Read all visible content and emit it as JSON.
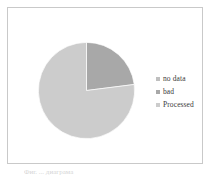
{
  "figure": {
    "background_color": "#ffffff",
    "frame_color": "#c9c9c9",
    "caption_text": "Фиг. ... диаграма"
  },
  "legend": {
    "position": "right",
    "items": [
      {
        "label": "no data",
        "color": "#bfbfbf"
      },
      {
        "label": "bad",
        "color": "#a8a8a8"
      },
      {
        "label": "Processed",
        "color": "#cccccc"
      }
    ]
  },
  "chart_data": {
    "type": "pie",
    "title": "",
    "categories": [
      "no data",
      "bad",
      "Processed"
    ],
    "values": [
      0,
      23,
      77
    ],
    "colors": [
      "#bfbfbf",
      "#a8a8a8",
      "#cccccc"
    ],
    "start_angle_deg": 0,
    "direction": "clockwise",
    "units": "percent",
    "legend_position": "right",
    "grid": false,
    "slices": [
      {
        "label": "no data",
        "value": 0,
        "color": "#bfbfbf",
        "start_deg": 0,
        "end_deg": 0
      },
      {
        "label": "bad",
        "value": 23,
        "color": "#a8a8a8",
        "start_deg": 0,
        "end_deg": 82.8
      },
      {
        "label": "Processed",
        "value": 77,
        "color": "#cccccc",
        "start_deg": 82.8,
        "end_deg": 360
      }
    ]
  }
}
